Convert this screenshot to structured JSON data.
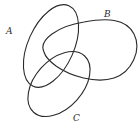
{
  "diagram": {
    "type": "venn",
    "sets": [
      {
        "id": "A",
        "label": "A"
      },
      {
        "id": "B",
        "label": "B"
      },
      {
        "id": "C",
        "label": "C"
      }
    ],
    "colors": {
      "stroke": "#2a2a2a",
      "background": "#ffffff"
    }
  }
}
